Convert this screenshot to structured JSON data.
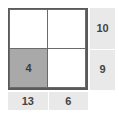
{
  "puzzle": {
    "type": "2x2-sum-grid",
    "grid": {
      "rows": 2,
      "cols": 2,
      "cells": [
        {
          "id": "r1c1",
          "value": "",
          "shaded": false
        },
        {
          "id": "r1c2",
          "value": "",
          "shaded": false
        },
        {
          "id": "r2c1",
          "value": "4",
          "shaded": true
        },
        {
          "id": "r2c2",
          "value": "",
          "shaded": false
        }
      ]
    },
    "row_sums": [
      {
        "id": "row-1-sum",
        "label": "10"
      },
      {
        "id": "row-2-sum",
        "label": "9"
      }
    ],
    "col_sums": [
      {
        "id": "col-1-sum",
        "label": "13"
      },
      {
        "id": "col-2-sum",
        "label": "6"
      }
    ]
  },
  "colors": {
    "background": "#ffffff",
    "cell_fill": "#ffffff",
    "cell_shaded": "#a9a9a9",
    "grid_border": "#5a5a5a",
    "clue_background": "#e9e9e9",
    "clue_text": "#444444",
    "cell_text": "#3a3a3a"
  }
}
